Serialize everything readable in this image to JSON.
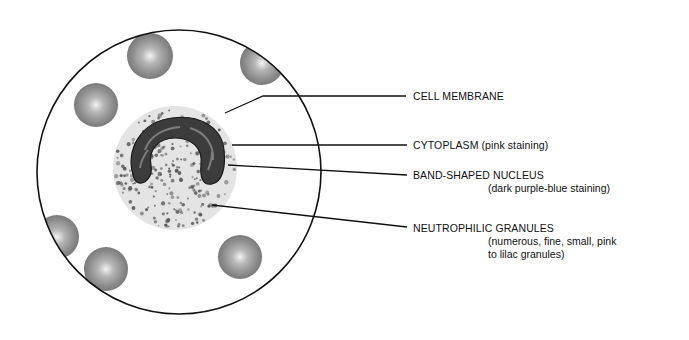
{
  "diagram": {
    "labels": [
      {
        "id": "cell-membrane",
        "title": "CELL MEMBRANE",
        "detail": ""
      },
      {
        "id": "cytoplasm",
        "title": "CYTOPLASM (pink staining)",
        "detail": ""
      },
      {
        "id": "band-nucleus",
        "title": "BAND-SHAPED NUCLEUS",
        "detail": "(dark purple-blue staining)"
      },
      {
        "id": "neutrophilic-granules",
        "title": "NEUTROPHILIC GRANULES",
        "detail_line1": "(numerous, fine, small, pink",
        "detail_line2": "to lilac granules)"
      }
    ],
    "colors": {
      "outline": "#111111",
      "rbc": "#8a8a8a",
      "cytoplasm": "#e6e6e6",
      "nucleus": "#3a3a3a",
      "granule": "#555555"
    }
  }
}
